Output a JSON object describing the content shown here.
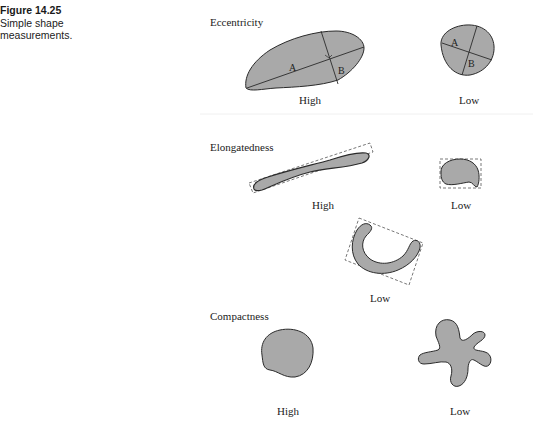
{
  "caption": {
    "figure_number": "Figure 14.25",
    "text_line1": "Simple shape",
    "text_line2": "measurements."
  },
  "colors": {
    "shape_fill": "#a9a9a9",
    "shape_stroke": "#2a2a2a",
    "box_stroke": "#555555",
    "background": "#ffffff"
  },
  "sections": {
    "eccentricity": {
      "title": "Eccentricity",
      "high_label": "High",
      "low_label": "Low",
      "axis_a": "A",
      "axis_b": "B",
      "axis_a_low": "A",
      "axis_b_low": "B"
    },
    "elongatedness": {
      "title": "Elongatedness",
      "high_label": "High",
      "low_label": "Low",
      "low2_label": "Low"
    },
    "compactness": {
      "title": "Compactness",
      "high_label": "High",
      "low_label": "Low"
    }
  }
}
